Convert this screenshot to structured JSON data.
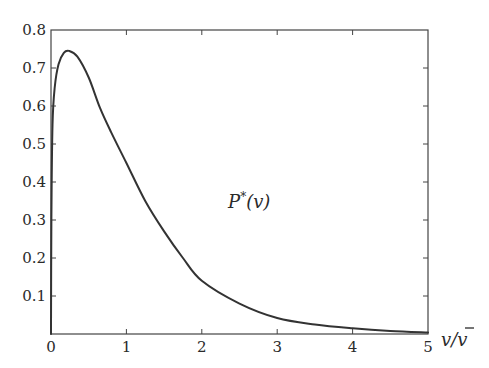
{
  "chart_data": {
    "type": "line",
    "title": "",
    "xlabel": "v/v̄",
    "ylabel": "",
    "xlim": [
      0,
      5
    ],
    "ylim": [
      0,
      0.8
    ],
    "grid": false,
    "legend": null,
    "x_ticks": [
      "0",
      "1",
      "2",
      "3",
      "4",
      "5"
    ],
    "y_ticks": [
      "0.1",
      "0.2",
      "0.3",
      "0.4",
      "0.5",
      "0.6",
      "0.7",
      "0.8"
    ],
    "annotations": [
      {
        "text": "P*(v)",
        "x": 2.35,
        "y": 0.45
      }
    ],
    "series": [
      {
        "name": "P*(v)",
        "color": "#333333",
        "x": [
          0,
          0.005,
          0.02,
          0.05,
          0.1,
          0.17,
          0.24,
          0.35,
          0.5,
          0.65,
          0.8,
          1.0,
          1.25,
          1.5,
          1.75,
          2.0,
          2.5,
          3.0,
          3.5,
          4.0,
          4.5,
          5.0
        ],
        "y": [
          0,
          0.3,
          0.55,
          0.65,
          0.71,
          0.74,
          0.745,
          0.73,
          0.675,
          0.595,
          0.53,
          0.45,
          0.35,
          0.27,
          0.2,
          0.14,
          0.08,
          0.042,
          0.025,
          0.015,
          0.008,
          0.004
        ]
      }
    ]
  },
  "labels": {
    "xlabel_main": "v/",
    "xlabel_bar": "v",
    "annotation_P": "P",
    "annotation_star": "*",
    "annotation_arg": "(v)"
  }
}
